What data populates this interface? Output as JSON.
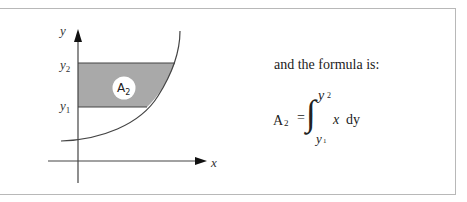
{
  "diagram": {
    "axis_y_label": "y",
    "axis_x_label": "x",
    "tick_upper": "y",
    "tick_upper_sub": "2",
    "tick_lower": "y",
    "tick_lower_sub": "1",
    "region_label": "A",
    "region_label_sub": "2",
    "colors": {
      "shade": "#a9a9a9",
      "line": "#444444",
      "frame": "#b8b8b8"
    }
  },
  "text": {
    "lead": "and the formula is:"
  },
  "formula": {
    "lhs": "A",
    "lhs_sub": "2",
    "equals": "=",
    "integral": "∫",
    "upper_limit": "y",
    "upper_limit_sub": "2",
    "lower_limit": "y",
    "lower_limit_sub": "1",
    "integrand": "x",
    "differential": "dy"
  }
}
